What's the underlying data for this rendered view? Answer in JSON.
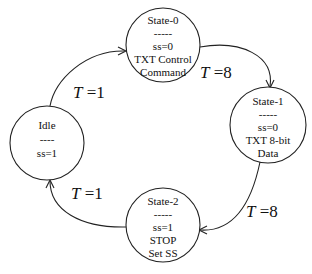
{
  "diagram": {
    "type": "state-machine",
    "states": [
      {
        "id": "state0",
        "lines": [
          "State-0",
          "-----",
          "ss=0",
          "TXT Control",
          "Command"
        ]
      },
      {
        "id": "state1",
        "lines": [
          "State-1",
          "-----",
          "ss=0",
          "TXT 8-bit",
          "Data"
        ]
      },
      {
        "id": "state2",
        "lines": [
          "State-2",
          "-----",
          "ss=1",
          "STOP",
          "Set SS"
        ]
      },
      {
        "id": "idle",
        "lines": [
          "Idle",
          "----",
          "ss=1"
        ]
      }
    ],
    "transitions": [
      {
        "from": "idle",
        "to": "state0",
        "var": "T",
        "eq": " =",
        "value": "1"
      },
      {
        "from": "state0",
        "to": "state1",
        "var": "T",
        "eq": " =",
        "value": "8"
      },
      {
        "from": "state1",
        "to": "state2",
        "var": "T",
        "eq": " =",
        "value": "8"
      },
      {
        "from": "state2",
        "to": "idle",
        "var": "T",
        "eq": " =",
        "value": "1"
      }
    ]
  }
}
